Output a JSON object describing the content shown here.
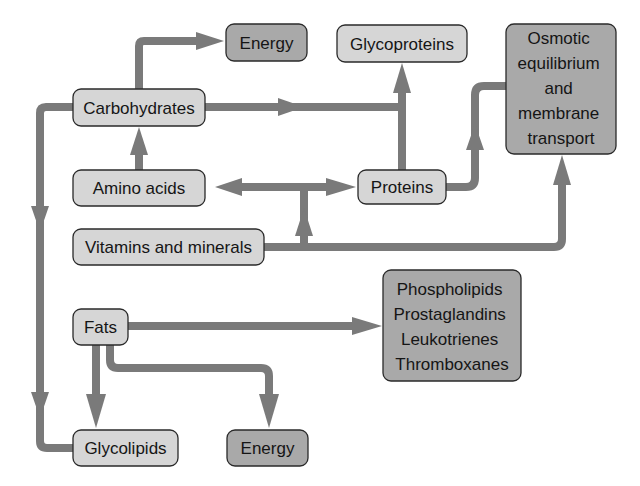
{
  "diagram": {
    "colors": {
      "light_fill": "#d6d6d6",
      "dark_fill": "#a9a9a9",
      "edge": "#7a7a7a",
      "border": "#2a2a2a",
      "text": "#151515"
    },
    "nodes": {
      "energy_top": {
        "label": "Energy",
        "style": "dark"
      },
      "glycoproteins": {
        "label": "Glycoproteins",
        "style": "light"
      },
      "osmotic": {
        "lines": [
          "Osmotic",
          "equilibrium",
          "and",
          "membrane",
          "transport"
        ],
        "style": "dark"
      },
      "carbohydrates": {
        "label": "Carbohydrates",
        "style": "light"
      },
      "amino_acids": {
        "label": "Amino acids",
        "style": "light"
      },
      "proteins": {
        "label": "Proteins",
        "style": "light"
      },
      "vitamins": {
        "label": "Vitamins and minerals",
        "style": "light"
      },
      "fats": {
        "label": "Fats",
        "style": "light"
      },
      "lipid_derivatives": {
        "lines": [
          "Phospholipids",
          "Prostaglandins",
          "Leukotrienes",
          "Thromboxanes"
        ],
        "style": "dark"
      },
      "glycolipids": {
        "label": "Glycolipids",
        "style": "light"
      },
      "energy_bottom": {
        "label": "Energy",
        "style": "dark"
      }
    },
    "edges": [
      {
        "from": "Carbohydrates",
        "to": "Energy"
      },
      {
        "from": "Carbohydrates",
        "to": "Glycoproteins"
      },
      {
        "from": "Carbohydrates",
        "to": "Glycolipids"
      },
      {
        "from": "Amino acids",
        "to": "Carbohydrates"
      },
      {
        "from": "Amino acids",
        "to": "Proteins",
        "bidirectional": true
      },
      {
        "from": "Vitamins and minerals",
        "to": "Amino acids / Proteins"
      },
      {
        "from": "Vitamins and minerals",
        "to": "Osmotic equilibrium and membrane transport"
      },
      {
        "from": "Proteins",
        "to": "Glycoproteins"
      },
      {
        "from": "Proteins",
        "to": "Osmotic equilibrium and membrane transport"
      },
      {
        "from": "Fats",
        "to": "Phospholipids / Prostaglandins / Leukotrienes / Thromboxanes"
      },
      {
        "from": "Fats",
        "to": "Glycolipids"
      },
      {
        "from": "Fats",
        "to": "Energy"
      }
    ]
  }
}
